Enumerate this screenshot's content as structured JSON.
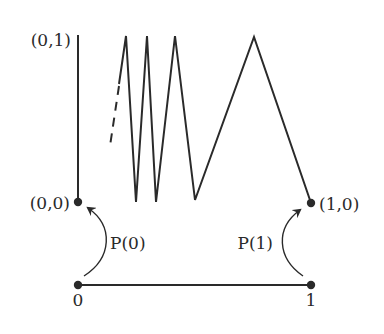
{
  "diagram": {
    "labels": {
      "top_left": "(0,1)",
      "origin": "(0,0)",
      "right_point": "(1,0)",
      "interval_start": "0",
      "interval_end": "1",
      "path0": "P(0)",
      "path1": "P(1)"
    },
    "colors": {
      "stroke": "#2a2a2a",
      "background": "#ffffff"
    }
  }
}
